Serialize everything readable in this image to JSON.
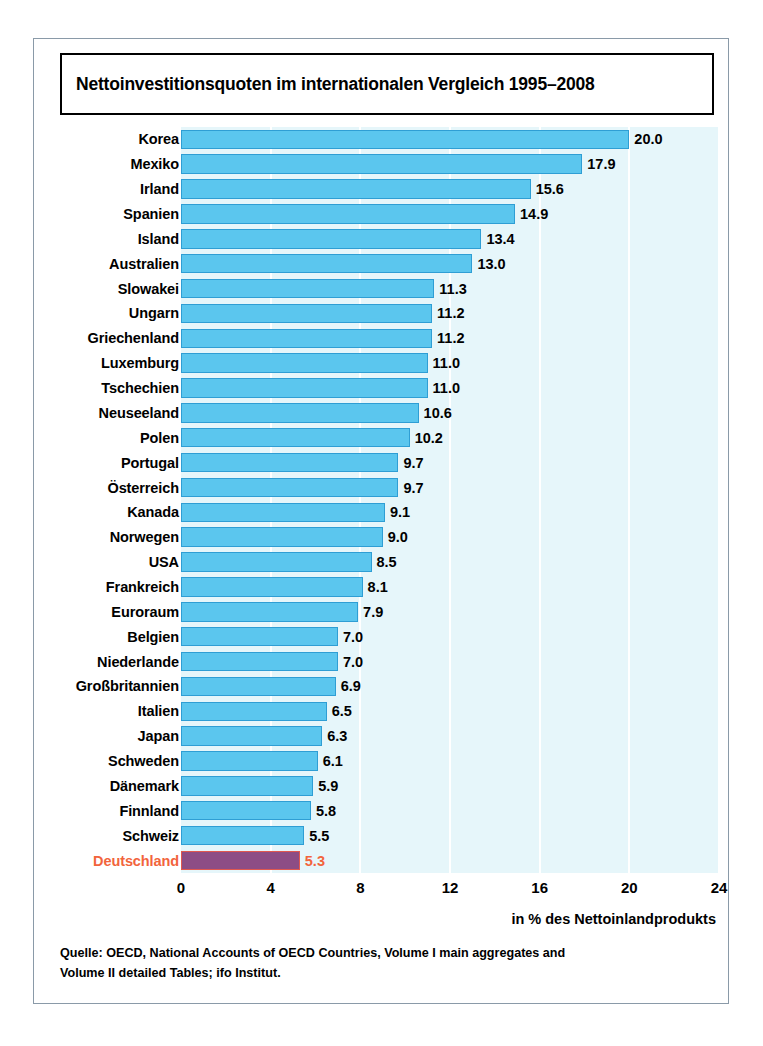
{
  "chart_data": {
    "type": "bar",
    "orientation": "horizontal",
    "title": "Nettoinvestitionsquoten im internationalen Vergleich 1995–2008",
    "xlabel": "in % des Nettoinlandprodukts",
    "ylabel": "",
    "xlim": [
      0,
      24
    ],
    "xticks": [
      0,
      4,
      8,
      12,
      16,
      20,
      24
    ],
    "xtick_labels": [
      "0",
      "4",
      "8",
      "12",
      "16",
      "20",
      "24"
    ],
    "grid": "vertical-white-gridlines",
    "legend": "none",
    "bar_color": "#5bc6ee",
    "bar_border_color": "#2f9ed4",
    "highlight_bar_color": "#8d4d85",
    "highlight_bar_border_color": "#e0584f",
    "highlight_label_color": "#f2643c",
    "plot_background": "#e6f6fa",
    "categories": [
      "Korea",
      "Mexiko",
      "Irland",
      "Spanien",
      "Island",
      "Australien",
      "Slowakei",
      "Ungarn",
      "Griechenland",
      "Luxemburg",
      "Tschechien",
      "Neuseeland",
      "Polen",
      "Portugal",
      "Österreich",
      "Kanada",
      "Norwegen",
      "USA",
      "Frankreich",
      "Euroraum",
      "Belgien",
      "Niederlande",
      "Großbritannien",
      "Italien",
      "Japan",
      "Schweden",
      "Dänemark",
      "Finnland",
      "Schweiz",
      "Deutschland"
    ],
    "values": [
      20.0,
      17.9,
      15.6,
      14.9,
      13.4,
      13.0,
      11.3,
      11.2,
      11.2,
      11.0,
      11.0,
      10.6,
      10.2,
      9.7,
      9.7,
      9.1,
      9.0,
      8.5,
      8.1,
      7.9,
      7.0,
      7.0,
      6.9,
      6.5,
      6.3,
      6.1,
      5.9,
      5.8,
      5.5,
      5.3
    ],
    "value_labels": [
      "20.0",
      "17.9",
      "15.6",
      "14.9",
      "13.4",
      "13.0",
      "11.3",
      "11.2",
      "11.2",
      "11.0",
      "11.0",
      "10.6",
      "10.2",
      "9.7",
      "9.7",
      "9.1",
      "9.0",
      "8.5",
      "8.1",
      "7.9",
      "7.0",
      "7.0",
      "6.9",
      "6.5",
      "6.3",
      "6.1",
      "5.9",
      "5.8",
      "5.5",
      "5.3"
    ],
    "highlighted_category": "Deutschland"
  },
  "source_note": {
    "line1": "Quelle: OECD, National Accounts of OECD Countries, Volume I main aggregates and",
    "line2": "Volume II detailed Tables; ifo Institut."
  }
}
